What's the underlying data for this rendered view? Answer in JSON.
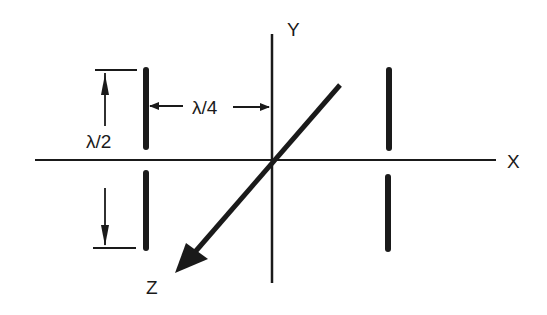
{
  "diagram": {
    "axes": {
      "x_label": "X",
      "y_label": "Y",
      "z_label": "Z"
    },
    "dimensions": {
      "vertical_span_label": "λ/2",
      "horizontal_offset_label": "λ/4"
    },
    "elements": [
      {
        "name": "left-dipole",
        "position": "x = -λ/4",
        "segments": 2
      },
      {
        "name": "right-dipole",
        "position": "x = +λ/4",
        "segments": 2
      }
    ],
    "colors": {
      "ink": "#1a1a1a",
      "background": "#ffffff"
    }
  }
}
